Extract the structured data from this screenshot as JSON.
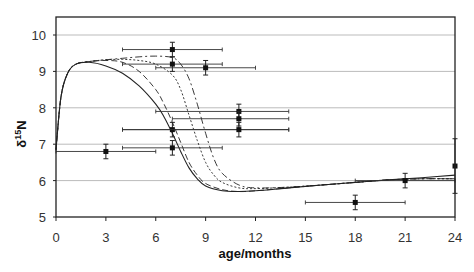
{
  "chart_data": {
    "type": "scatter",
    "title": "",
    "xlabel": "age/months",
    "ylabel": "δ15N",
    "ylabel_main": "δ",
    "ylabel_sup": "15",
    "ylabel_tail": "N",
    "xlim": [
      0,
      24
    ],
    "ylim": [
      5,
      10.5
    ],
    "xticks": [
      0,
      3,
      6,
      9,
      12,
      15,
      18,
      21,
      24
    ],
    "yticks": [
      5,
      6,
      7,
      8,
      9,
      10
    ],
    "grid": "horizontal",
    "legend": "none",
    "points": [
      {
        "x": 3,
        "y": 6.8,
        "xmin": 0,
        "xmax": 6,
        "yerr": 0.2
      },
      {
        "x": 7,
        "y": 9.6,
        "xmin": 4,
        "xmax": 10,
        "yerr": 0.2
      },
      {
        "x": 7,
        "y": 9.2,
        "xmin": 4,
        "xmax": 10,
        "yerr": 0.2
      },
      {
        "x": 9,
        "y": 9.1,
        "xmin": 6,
        "xmax": 12,
        "yerr": 0.2
      },
      {
        "x": 7,
        "y": 7.4,
        "xmin": 4,
        "xmax": 14,
        "yerr": 0.2
      },
      {
        "x": 7,
        "y": 6.9,
        "xmin": 4,
        "xmax": 10,
        "yerr": 0.2
      },
      {
        "x": 11,
        "y": 7.9,
        "xmin": 6,
        "xmax": 14,
        "yerr": 0.2
      },
      {
        "x": 11,
        "y": 7.7,
        "xmin": 7,
        "xmax": 14,
        "yerr": 0.2
      },
      {
        "x": 11,
        "y": 7.4,
        "xmin": 4,
        "xmax": 14,
        "yerr": 0.2
      },
      {
        "x": 18,
        "y": 5.4,
        "xmin": 15,
        "xmax": 21,
        "yerr": 0.2
      },
      {
        "x": 21,
        "y": 6.0,
        "xmin": 18,
        "xmax": 24,
        "yerr": 0.2
      },
      {
        "x": 24,
        "y": 6.4,
        "xmin": 24,
        "xmax": 24,
        "yerr": 0.75
      }
    ],
    "series": [
      {
        "name": "model-solid",
        "style": "solid",
        "x": [
          0,
          0.3,
          0.7,
          1.2,
          2,
          3,
          4,
          5,
          6,
          6.5,
          7,
          7.5,
          8,
          8.5,
          9,
          10,
          11,
          12,
          14,
          16,
          18,
          20,
          22,
          24
        ],
        "y": [
          6.85,
          8.3,
          8.95,
          9.2,
          9.25,
          9.15,
          8.95,
          8.6,
          8.1,
          7.75,
          7.3,
          6.8,
          6.35,
          6.05,
          5.85,
          5.72,
          5.7,
          5.72,
          5.8,
          5.88,
          5.95,
          6.02,
          6.08,
          6.15
        ]
      },
      {
        "name": "model-dashed",
        "style": "dashed",
        "x": [
          0,
          0.3,
          0.7,
          1.2,
          2,
          3,
          4,
          5,
          6,
          6.5,
          7,
          7.5,
          8,
          8.5,
          9,
          10,
          11,
          12,
          14,
          16,
          18,
          20,
          22,
          24
        ],
        "y": [
          6.85,
          8.3,
          8.95,
          9.2,
          9.27,
          9.3,
          9.25,
          9.0,
          8.5,
          8.1,
          7.6,
          7.05,
          6.5,
          6.15,
          5.92,
          5.75,
          5.7,
          5.72,
          5.8,
          5.88,
          5.95,
          6.02,
          6.05,
          6.05
        ]
      },
      {
        "name": "model-dotted",
        "style": "dotted",
        "x": [
          0,
          0.3,
          0.7,
          1.2,
          2,
          3,
          4,
          5,
          6,
          7,
          7.5,
          8,
          8.5,
          9,
          9.5,
          10,
          11,
          12,
          14,
          16,
          18,
          20,
          22,
          24
        ],
        "y": [
          6.85,
          8.3,
          8.95,
          9.2,
          9.27,
          9.32,
          9.33,
          9.3,
          9.2,
          8.9,
          8.5,
          7.8,
          7.1,
          6.5,
          6.15,
          5.95,
          5.8,
          5.78,
          5.82,
          5.88,
          5.95,
          6.02,
          6.05,
          6.05
        ]
      },
      {
        "name": "model-dashdot",
        "style": "dashdot",
        "x": [
          0,
          0.3,
          0.7,
          1.2,
          2,
          3,
          4,
          5,
          6,
          7,
          7.5,
          8,
          8.5,
          9,
          9.5,
          10,
          11,
          12,
          14,
          16,
          18,
          20,
          22,
          24
        ],
        "y": [
          6.85,
          8.3,
          8.95,
          9.2,
          9.27,
          9.32,
          9.36,
          9.4,
          9.42,
          9.38,
          9.2,
          8.8,
          8.1,
          7.3,
          6.6,
          6.2,
          5.88,
          5.8,
          5.82,
          5.88,
          5.95,
          6.02,
          6.05,
          6.05
        ]
      }
    ]
  }
}
